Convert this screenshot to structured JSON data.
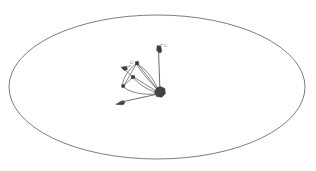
{
  "figure": {
    "title": "",
    "background_color": "#ffffff",
    "stroke_color": "#6e6e6e",
    "node_color": "#3a3a3a",
    "blob_color": "#434343"
  },
  "diagram_data": {
    "type": "diagram",
    "description": "Thin gray ellipse outline enclosing a small vector/graph sketch near the center",
    "ellipse": {
      "center_x": 157,
      "center_y": 87,
      "radius_x": 148,
      "radius_y": 72,
      "stroke": "#6e6e6e",
      "stroke_width": 0.9,
      "fill": "none"
    },
    "origin_blob": {
      "center_x": 160,
      "center_y": 92,
      "radius": 5.4,
      "fill": "#434343"
    },
    "square_nodes": [
      {
        "name": "node-upper",
        "x": 137,
        "y": 63,
        "size": 3.2
      },
      {
        "name": "node-center",
        "x": 133,
        "y": 77,
        "size": 3.2
      },
      {
        "name": "node-lower-left",
        "x": 123,
        "y": 86,
        "size": 3.0
      }
    ],
    "arrow_markers": [
      {
        "name": "arrow-up-right",
        "tip_x": 158,
        "tip_y": 46,
        "label": "C"
      },
      {
        "name": "arrow-left",
        "tip_x": 121,
        "tip_y": 67,
        "label": "C"
      },
      {
        "name": "arrow-down-left",
        "tip_x": 116,
        "tip_y": 104,
        "label": ""
      }
    ],
    "labels": [
      {
        "text": "C",
        "x": 164,
        "y": 47
      },
      {
        "text": "C",
        "x": 130,
        "y": 64
      }
    ],
    "straight_edges": [
      {
        "from": "origin_blob",
        "to": "arrow-up-right"
      },
      {
        "from": "origin_blob",
        "to": "arrow-down-left"
      },
      {
        "from": "origin_blob",
        "to": "node-upper"
      },
      {
        "from": "origin_blob",
        "to": "node-center"
      },
      {
        "from": "node-center",
        "to": "arrow-left"
      },
      {
        "from": "node-upper",
        "to": "node-lower-left"
      }
    ],
    "curved_edges": [
      {
        "from": "node-upper",
        "to": "origin_blob",
        "bulge": "left"
      },
      {
        "from": "node-center",
        "to": "origin_blob",
        "bulge": "down"
      },
      {
        "from": "node-lower-left",
        "to": "origin_blob",
        "bulge": "down"
      },
      {
        "from": "node-upper",
        "to": "node-lower-left",
        "bulge": "left"
      }
    ]
  }
}
